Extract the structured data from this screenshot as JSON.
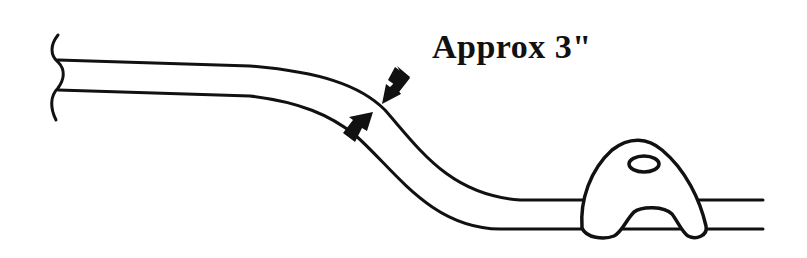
{
  "diagram": {
    "label": "Approx 3\"",
    "colors": {
      "stroke": "#111111",
      "background": "#ffffff"
    },
    "elements": [
      {
        "name": "cable",
        "description": "two parallel lines bending downward"
      },
      {
        "name": "break-mark",
        "description": "wavy break line at left end"
      },
      {
        "name": "arrow-upper",
        "description": "arrow pointing down-left at bend"
      },
      {
        "name": "arrow-lower",
        "description": "arrow pointing up-right at bend"
      },
      {
        "name": "clip",
        "description": "arched clip with oval hole holding cable"
      }
    ]
  }
}
